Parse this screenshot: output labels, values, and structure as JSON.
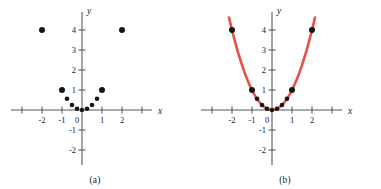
{
  "figure": {
    "background": "#ffffff",
    "axis_color": "#59595b",
    "point_color": "#161616",
    "curve_color": "#e8504a"
  },
  "panels": [
    {
      "id": "a",
      "caption": "(a)",
      "axis_label_x": "x",
      "axis_label_y": "y",
      "x_ticks": [
        -3,
        -2,
        -1,
        1,
        2,
        3
      ],
      "x_tick_labels": [
        "",
        "-2",
        "-1",
        "1",
        "2",
        ""
      ],
      "y_ticks": [
        4,
        3,
        2,
        1,
        -1,
        -2
      ],
      "y_tick_labels": [
        "4",
        "3",
        "2",
        "1",
        "-1",
        "-2"
      ],
      "origin_label": "0",
      "xlim": [
        -3.5,
        3.5
      ],
      "ylim": [
        -2.6,
        4.9
      ],
      "has_curve": false
    },
    {
      "id": "b",
      "caption": "(b)",
      "axis_label_x": "x",
      "axis_label_y": "y",
      "x_ticks": [
        -3,
        -2,
        -1,
        1,
        2,
        3
      ],
      "x_tick_labels": [
        "",
        "-2",
        "-1",
        "1",
        "2",
        ""
      ],
      "y_ticks": [
        4,
        3,
        2,
        1,
        -1,
        -2
      ],
      "y_tick_labels": [
        "4",
        "3",
        "2",
        "1",
        "-1",
        "-2"
      ],
      "origin_label": "0",
      "xlim": [
        -3.5,
        3.5
      ],
      "ylim": [
        -2.6,
        4.9
      ],
      "has_curve": true
    }
  ],
  "chart_data": {
    "type": "scatter",
    "title": "",
    "xlabel": "x",
    "ylabel": "y",
    "xlim": [
      -3.5,
      3.5
    ],
    "ylim": [
      -2.6,
      4.9
    ],
    "grid": false,
    "legend": "none",
    "series": [
      {
        "name": "data points",
        "type": "scatter",
        "marker": "filled-circle",
        "color": "#161616",
        "x": [
          -2,
          -1,
          -0.75,
          -0.5,
          -0.25,
          0,
          0.25,
          0.5,
          0.75,
          1,
          2
        ],
        "y": [
          4,
          1,
          0.5625,
          0.25,
          0.0625,
          0,
          0.0625,
          0.25,
          0.5625,
          1,
          4
        ]
      },
      {
        "name": "fitted curve y = x^2",
        "type": "line",
        "color": "#e8504a",
        "equation": "y = x^2",
        "panel": "b",
        "x_range": [
          -2.15,
          2.15
        ]
      }
    ]
  }
}
